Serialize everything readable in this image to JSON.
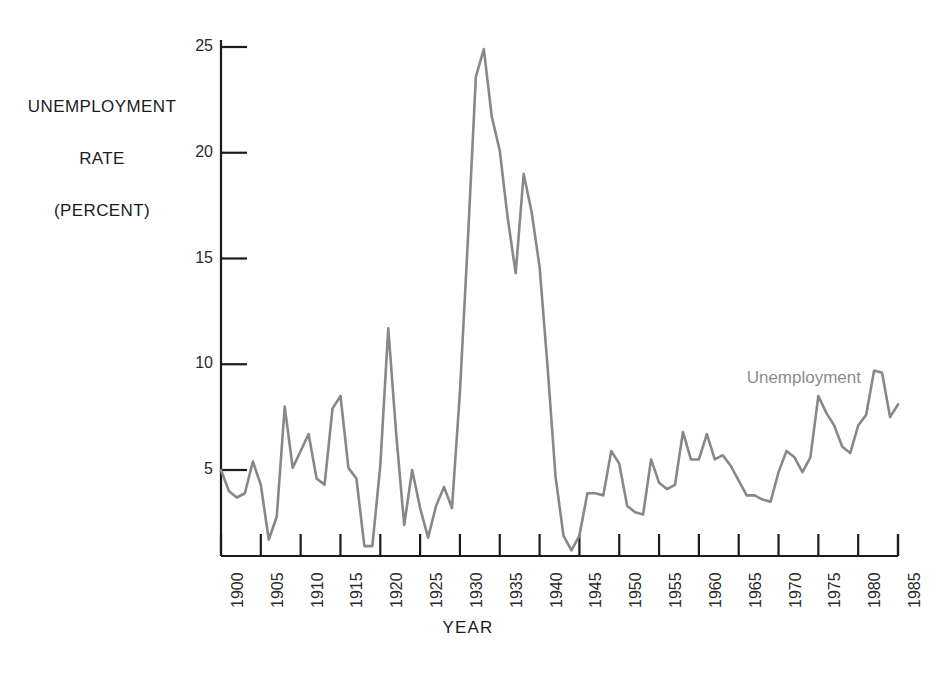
{
  "chart_data": {
    "type": "line",
    "title": "",
    "xlabel": "YEAR",
    "ylabel": "UNEMPLOYMENT RATE (PERCENT)",
    "ylabel_lines": [
      "UNEMPLOYMENT",
      "RATE",
      "(PERCENT)"
    ],
    "xlim": [
      1900,
      1985
    ],
    "ylim": [
      0,
      26
    ],
    "grid": false,
    "legend_position": "inline-right",
    "yticks": [
      5,
      10,
      15,
      20,
      25
    ],
    "ytick_labels": [
      "5",
      "10",
      "15",
      "20",
      "25"
    ],
    "xticks": [
      1900,
      1905,
      1910,
      1915,
      1920,
      1925,
      1930,
      1935,
      1940,
      1945,
      1950,
      1955,
      1960,
      1965,
      1970,
      1975,
      1980,
      1985
    ],
    "xtick_labels": [
      "1900",
      "1905",
      "1910",
      "1915",
      "1920",
      "1925",
      "1930",
      "1935",
      "1940",
      "1945",
      "1950",
      "1955",
      "1960",
      "1965",
      "1970",
      "1975",
      "1980",
      "1985"
    ],
    "series": [
      {
        "name": "Unemployment",
        "color": "#888888",
        "x": [
          1900,
          1901,
          1902,
          1903,
          1904,
          1905,
          1906,
          1907,
          1908,
          1909,
          1910,
          1911,
          1912,
          1913,
          1914,
          1915,
          1916,
          1917,
          1918,
          1919,
          1920,
          1921,
          1922,
          1923,
          1924,
          1925,
          1926,
          1927,
          1928,
          1929,
          1930,
          1931,
          1932,
          1933,
          1934,
          1935,
          1936,
          1937,
          1938,
          1939,
          1940,
          1941,
          1942,
          1943,
          1944,
          1945,
          1946,
          1947,
          1948,
          1949,
          1950,
          1951,
          1952,
          1953,
          1954,
          1955,
          1956,
          1957,
          1958,
          1959,
          1960,
          1961,
          1962,
          1963,
          1964,
          1965,
          1966,
          1967,
          1968,
          1969,
          1970,
          1971,
          1972,
          1973,
          1974,
          1975,
          1976,
          1977,
          1978,
          1979,
          1980,
          1981,
          1982,
          1983,
          1984,
          1985
        ],
        "values": [
          5.0,
          4.0,
          3.7,
          3.9,
          5.4,
          4.3,
          1.7,
          2.8,
          8.0,
          5.1,
          5.9,
          6.7,
          4.6,
          4.3,
          7.9,
          8.5,
          5.1,
          4.6,
          1.4,
          1.4,
          5.2,
          11.7,
          6.7,
          2.4,
          5.0,
          3.2,
          1.8,
          3.3,
          4.2,
          3.2,
          8.7,
          15.9,
          23.6,
          24.9,
          21.7,
          20.1,
          16.9,
          14.3,
          19.0,
          17.2,
          14.6,
          9.9,
          4.7,
          1.9,
          1.2,
          1.9,
          3.9,
          3.9,
          3.8,
          5.9,
          5.3,
          3.3,
          3.0,
          2.9,
          5.5,
          4.4,
          4.1,
          4.3,
          6.8,
          5.5,
          5.5,
          6.7,
          5.5,
          5.7,
          5.2,
          4.5,
          3.8,
          3.8,
          3.6,
          3.5,
          4.9,
          5.9,
          5.6,
          4.9,
          5.6,
          8.5,
          7.7,
          7.1,
          6.1,
          5.8,
          7.1,
          7.6,
          9.7,
          9.6,
          7.5,
          8.1
        ]
      }
    ],
    "annotations": [
      {
        "text": "Unemployment",
        "x": 1966,
        "y": 9.3,
        "color": "#8d8d8d"
      }
    ]
  },
  "axes": {
    "y_title": "UNEMPLOYMENT\nRATE\n(PERCENT)",
    "x_title": "YEAR"
  },
  "legend": {
    "entries": [
      {
        "label": "Unemployment",
        "color": "#888888"
      }
    ]
  }
}
